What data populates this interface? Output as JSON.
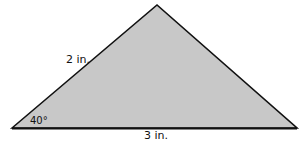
{
  "diagram": {
    "type": "triangle",
    "fill_color": "#c8c8c8",
    "stroke_color": "#111111",
    "vertices": {
      "left": [
        12,
        128
      ],
      "apex": [
        157,
        5
      ],
      "right": [
        297,
        128
      ]
    },
    "labels": {
      "left_side": "2 in.",
      "base": "3 in.",
      "angle": "40°"
    }
  }
}
